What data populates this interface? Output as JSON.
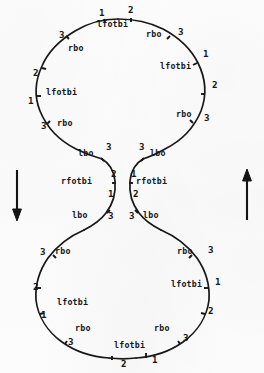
{
  "figure": {
    "background_color": "#fcfcfc",
    "ink_color": "#171717",
    "lobes": [
      {
        "name": "upper-lobe",
        "center_x": 132,
        "center_y": 88
      },
      {
        "name": "lower-lobe",
        "center_x": 132,
        "center_y": 287
      }
    ],
    "arrows": [
      {
        "name": "left-direction-arrow",
        "direction": "down",
        "x": 17,
        "y": 170,
        "length": 50
      },
      {
        "name": "right-direction-arrow",
        "direction": "up",
        "x": 247,
        "y": 170,
        "length": 50
      }
    ],
    "edge_labels": [
      {
        "id": "u-top-lfotbi",
        "text": "lfotbi",
        "x": 99,
        "y": 24,
        "kind": "word"
      },
      {
        "id": "u-top-rbo",
        "text": "rbo",
        "x": 147,
        "y": 33,
        "kind": "word"
      },
      {
        "id": "u-ul-rbo",
        "text": "rbo",
        "x": 69,
        "y": 47,
        "kind": "word"
      },
      {
        "id": "u-l-lfotbi",
        "text": "lfotbi",
        "x": 47,
        "y": 91,
        "kind": "word"
      },
      {
        "id": "u-ll-rbo",
        "text": "rbo",
        "x": 58,
        "y": 122,
        "kind": "word"
      },
      {
        "id": "u-r-lfotbi",
        "text": "lfotbi",
        "x": 162,
        "y": 65,
        "kind": "word"
      },
      {
        "id": "u-lr-rbo",
        "text": "rbo",
        "x": 177,
        "y": 113,
        "kind": "word"
      },
      {
        "id": "w-left-lbo",
        "text": "lbo",
        "x": 79,
        "y": 152,
        "kind": "word"
      },
      {
        "id": "w-right-lbo",
        "text": "lbo",
        "x": 151,
        "y": 152,
        "kind": "word"
      },
      {
        "id": "w-left-rfotbi",
        "text": "rfotbi",
        "x": 62,
        "y": 180,
        "kind": "word"
      },
      {
        "id": "w-right-rfotbi",
        "text": "rfotbi",
        "x": 137,
        "y": 180,
        "kind": "word"
      },
      {
        "id": "w-left-lbo2",
        "text": "lbo",
        "x": 73,
        "y": 214,
        "kind": "word"
      },
      {
        "id": "w-right-lbo2",
        "text": "lbo",
        "x": 144,
        "y": 214,
        "kind": "word"
      },
      {
        "id": "l-ul-rbo",
        "text": "rbo",
        "x": 56,
        "y": 250,
        "kind": "word"
      },
      {
        "id": "l-ur-rbo",
        "text": "rbo",
        "x": 178,
        "y": 250,
        "kind": "word"
      },
      {
        "id": "l-l-lfotbi",
        "text": "lfotbi",
        "x": 58,
        "y": 301,
        "kind": "word"
      },
      {
        "id": "l-r-lfotbi",
        "text": "lfotbi",
        "x": 172,
        "y": 283,
        "kind": "word"
      },
      {
        "id": "l-ll-rbo",
        "text": "rbo",
        "x": 76,
        "y": 327,
        "kind": "word"
      },
      {
        "id": "l-lr-rbo",
        "text": "rbo",
        "x": 155,
        "y": 327,
        "kind": "word"
      },
      {
        "id": "l-bot-lfotbi",
        "text": "lfotbi",
        "x": 116,
        "y": 343,
        "kind": "word"
      }
    ],
    "turn_numbers": [
      {
        "id": "u-n1a",
        "text": "1",
        "x": 99,
        "y": 11
      },
      {
        "id": "u-n2a",
        "text": "2",
        "x": 128,
        "y": 8
      },
      {
        "id": "u-n3a",
        "text": "3",
        "x": 178,
        "y": 30
      },
      {
        "id": "u-n3b",
        "text": "3",
        "x": 60,
        "y": 33
      },
      {
        "id": "u-n2b",
        "text": "2",
        "x": 34,
        "y": 71
      },
      {
        "id": "u-n1b",
        "text": "1",
        "x": 29,
        "y": 99
      },
      {
        "id": "u-n3c",
        "text": "3",
        "x": 42,
        "y": 124
      },
      {
        "id": "u-n1c",
        "text": "1",
        "x": 203,
        "y": 52
      },
      {
        "id": "u-n2c",
        "text": "2",
        "x": 212,
        "y": 83
      },
      {
        "id": "u-n3d",
        "text": "3",
        "x": 205,
        "y": 116
      },
      {
        "id": "w-n3l",
        "text": "3",
        "x": 107,
        "y": 145
      },
      {
        "id": "w-n2l",
        "text": "2",
        "x": 112,
        "y": 172
      },
      {
        "id": "w-n1l",
        "text": "1",
        "x": 109,
        "y": 192
      },
      {
        "id": "w-n3l2",
        "text": "3",
        "x": 109,
        "y": 214
      },
      {
        "id": "w-n3r",
        "text": "3",
        "x": 139,
        "y": 145
      },
      {
        "id": "w-n1r",
        "text": "1",
        "x": 131,
        "y": 172
      },
      {
        "id": "w-n2r",
        "text": "2",
        "x": 133,
        "y": 192
      },
      {
        "id": "w-n3r2",
        "text": "3",
        "x": 129,
        "y": 214
      },
      {
        "id": "l-n3a",
        "text": "3",
        "x": 41,
        "y": 250
      },
      {
        "id": "l-n2a",
        "text": "2",
        "x": 34,
        "y": 285
      },
      {
        "id": "l-n1a",
        "text": "1",
        "x": 42,
        "y": 313
      },
      {
        "id": "l-n3b",
        "text": "3",
        "x": 69,
        "y": 340
      },
      {
        "id": "l-n3c",
        "text": "3",
        "x": 208,
        "y": 248
      },
      {
        "id": "l-n1b",
        "text": "1",
        "x": 215,
        "y": 280
      },
      {
        "id": "l-n2b",
        "text": "2",
        "x": 208,
        "y": 309
      },
      {
        "id": "l-n3d",
        "text": "3",
        "x": 183,
        "y": 336
      },
      {
        "id": "l-n2c",
        "text": "2",
        "x": 122,
        "y": 362
      },
      {
        "id": "l-n1c",
        "text": "1",
        "x": 153,
        "y": 358
      }
    ],
    "paths": {
      "upper_lobe": "M 107,22 C 95,23 82,28 71,36 C 58,45 47,57 41,71 C 35,84 34,96 39,109 C 45,124 58,137 72,145 C 82,151 94,155 104,156",
      "upper_lobe_right": "M 107,22 C 122,21 138,23 152,29 C 168,36 182,47 191,60 C 201,75 204,92 200,108 C 196,124 185,137 172,145 C 164,150 154,154 146,156",
      "waist_left": "M 104,156 C 110,159 115,166 116,176 C 117,187 114,198 108,207 C 102,216 93,222 85,226",
      "waist_right": "M 146,156 C 139,159 134,166 133,176 C 132,187 135,198 141,207 C 147,216 156,222 164,226",
      "lower_lobe_left": "M 85,226 C 72,231 59,241 50,253 C 40,266 35,281 36,296 C 38,313 47,328 60,339 C 74,350 92,356 109,357",
      "lower_lobe_right": "M 164,226 C 177,231 190,241 199,253 C 209,266 214,281 213,296 C 211,313 202,328 189,339 C 175,350 157,356 140,357",
      "bottom_join": "M 109,357 L 140,357"
    }
  }
}
